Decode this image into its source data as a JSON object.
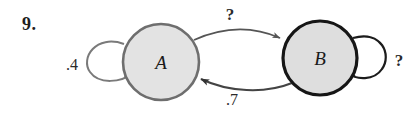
{
  "figure": {
    "problem_number": "9.",
    "type": "markov-chain-state-diagram",
    "background_color": "#ffffff"
  },
  "nodes": [
    {
      "id": "A",
      "label": "A",
      "cx": 161,
      "cy": 62,
      "r": 38,
      "fill": "#e3e3e3",
      "stroke": "#6e6e6e",
      "stroke_width": 2.6
    },
    {
      "id": "B",
      "label": "B",
      "cx": 320,
      "cy": 58,
      "r": 37,
      "fill": "#dedede",
      "stroke": "#161616",
      "stroke_width": 3.2
    }
  ],
  "edges": [
    {
      "id": "a-to-b",
      "from": "A",
      "to": "B",
      "label": "?",
      "label_x": 230,
      "label_y": 20,
      "label_kind": "unknown",
      "stroke": "#555555"
    },
    {
      "id": "b-to-a",
      "from": "B",
      "to": "A",
      "label": ".7",
      "label_x": 232,
      "label_y": 105,
      "label_kind": "probability",
      "stroke": "#444444"
    },
    {
      "id": "a-self-loop",
      "from": "A",
      "to": "A",
      "label": ".4",
      "label_x": 62,
      "label_y": 70,
      "label_kind": "probability",
      "stroke": "#7a7a7a"
    },
    {
      "id": "b-self-loop",
      "from": "B",
      "to": "B",
      "label": "?",
      "label_x": 393,
      "label_y": 66,
      "label_kind": "unknown",
      "stroke": "#1c1c1c"
    }
  ],
  "colors": {
    "node_a_fill": "#e3e3e3",
    "node_a_stroke": "#6e6e6e",
    "node_b_fill": "#dedede",
    "node_b_stroke": "#161616",
    "text": "#1d1d1d"
  }
}
